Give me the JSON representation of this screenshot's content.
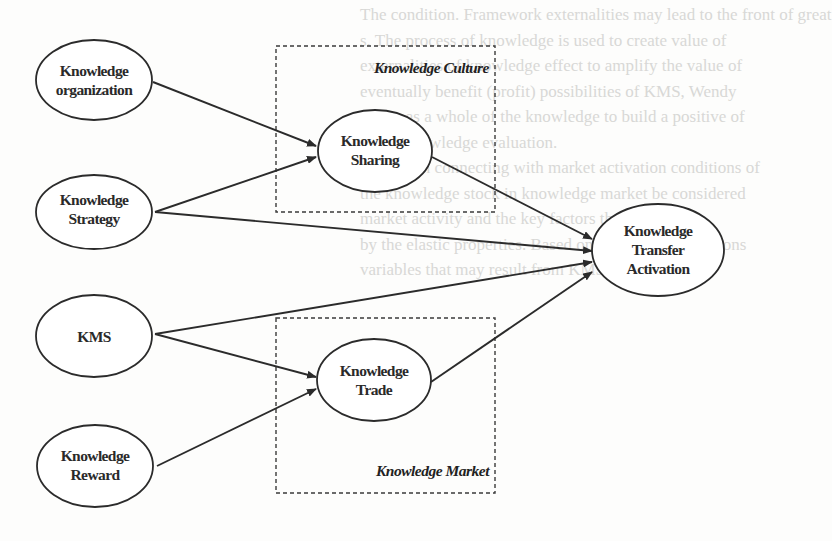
{
  "background_text": [
    "The condition. Framework externalities may lead to the front of great",
    "s. The process of knowledge is used to create value of",
    "externalities of knowledge effect to amplify the value of",
    "eventually benefit (profit) possibilities of KMS, Wendy",
    "works as a whole of the knowledge to build a positive of",
    "of the knowledge evaluation.",
    "amplify in connecting with market activation conditions of",
    "the knowledge stock in knowledge market be considered",
    "market activity and the key factors that of business",
    "by the elastic properties. Based on work of organizations",
    "variables that may result from KMS with KMS."
  ],
  "groups": {
    "culture": {
      "label": "Knowledge Culture"
    },
    "market": {
      "label": "Knowledge Market"
    }
  },
  "nodes": {
    "organization": {
      "line1": "Knowledge",
      "line2": "organization"
    },
    "strategy": {
      "line1": "Knowledge",
      "line2": "Strategy"
    },
    "kms": {
      "line1": "KMS"
    },
    "reward": {
      "line1": "Knowledge",
      "line2": "Reward"
    },
    "sharing": {
      "line1": "Knowledge",
      "line2": "Sharing"
    },
    "trade": {
      "line1": "Knowledge",
      "line2": "Trade"
    },
    "transfer": {
      "line1": "Knowledge",
      "line2": "Transfer",
      "line3": "Activation"
    }
  },
  "edges": [
    {
      "from": "Knowledge organization",
      "to": "Knowledge Sharing"
    },
    {
      "from": "Knowledge Strategy",
      "to": "Knowledge Sharing"
    },
    {
      "from": "Knowledge Strategy",
      "to": "Knowledge Transfer Activation"
    },
    {
      "from": "KMS",
      "to": "Knowledge Transfer Activation"
    },
    {
      "from": "KMS",
      "to": "Knowledge Trade"
    },
    {
      "from": "Knowledge Reward",
      "to": "Knowledge Trade"
    },
    {
      "from": "Knowledge Sharing",
      "to": "Knowledge Transfer Activation"
    },
    {
      "from": "Knowledge Trade",
      "to": "Knowledge Transfer Activation"
    }
  ]
}
